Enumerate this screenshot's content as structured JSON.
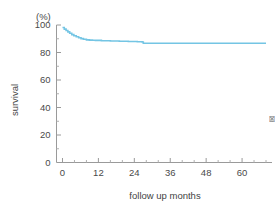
{
  "chart_data": {
    "type": "line",
    "title": "",
    "subtitle": "",
    "xlabel": "follow up months",
    "ylabel": "survival",
    "unit_label": "(%)",
    "xlim": [
      -2,
      70
    ],
    "ylim": [
      0,
      100
    ],
    "grid": false,
    "legend": null,
    "x_ticks": [
      0,
      12,
      24,
      36,
      48,
      60
    ],
    "x_tick_labels": [
      "0",
      "12",
      "24",
      "36",
      "48",
      "60"
    ],
    "x_minor_step": 4,
    "y_ticks": [
      0,
      20,
      40,
      60,
      80,
      100
    ],
    "y_tick_labels": [
      "0",
      "20",
      "40",
      "60",
      "80",
      "100"
    ],
    "y_minor_step": 10,
    "series": [
      {
        "name": "survival",
        "color": "#74c5e4",
        "line_width": 1.6,
        "step": "post",
        "x": [
          0,
          0.6,
          1.2,
          1.8,
          2.4,
          3.1,
          3.8,
          4.6,
          5.4,
          6.2,
          7.0,
          8.0,
          9.0,
          10.0,
          11.0,
          13.0,
          16.0,
          19.0,
          22.0,
          25.0,
          26.6,
          27.0,
          32.0,
          40.0,
          50.0,
          60.0,
          68.0
        ],
        "y": [
          98.2,
          97.0,
          96.0,
          95.0,
          94.0,
          93.0,
          92.2,
          91.4,
          90.7,
          90.1,
          89.6,
          89.2,
          89.0,
          88.9,
          88.8,
          88.6,
          88.4,
          88.2,
          88.0,
          87.8,
          87.6,
          86.7,
          86.7,
          86.7,
          86.7,
          86.7,
          86.7
        ]
      }
    ]
  },
  "artifact": {
    "edge_text": "図"
  }
}
